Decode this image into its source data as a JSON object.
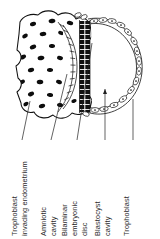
{
  "figure": {
    "orientation": "labels rotated 90 degrees counter-clockwise",
    "background_color": "#ffffff",
    "ink_color": "#111111"
  },
  "labels": [
    {
      "id": "trophoblast-invading-endometrium",
      "lines": [
        "Trophoblast",
        "invading endometrium"
      ],
      "line1": "Trophoblast",
      "line2": "invading endometrium"
    },
    {
      "id": "amniotic-cavity",
      "lines": [
        "Amniotic",
        "cavity"
      ],
      "line1": "Amniotic",
      "line2": "cavity"
    },
    {
      "id": "bilaminar-embryonic-disc",
      "lines": [
        "Bilaminar",
        "embryonic",
        "disc"
      ],
      "line1": "Bilaminar",
      "line2": "embryonic",
      "line3": "disc"
    },
    {
      "id": "blastocyst-cavity",
      "lines": [
        "Blastocyst",
        "cavity"
      ],
      "line1": "Blastocyst",
      "line2": "cavity"
    },
    {
      "id": "trophoblast",
      "lines": [
        "Trophoblast"
      ],
      "line1": "Trophoblast"
    }
  ],
  "structures": [
    {
      "id": "endometrium",
      "name": "Endometrium (stippled maternal tissue with dark nuclei)"
    },
    {
      "id": "amniotic-cavity-space",
      "name": "Amniotic cavity"
    },
    {
      "id": "bilaminar-disc",
      "name": "Bilaminar embryonic disc"
    },
    {
      "id": "blastocyst-cavity-space",
      "name": "Blastocyst cavity"
    },
    {
      "id": "trophoblast-layer",
      "name": "Trophoblast cell layer"
    }
  ]
}
